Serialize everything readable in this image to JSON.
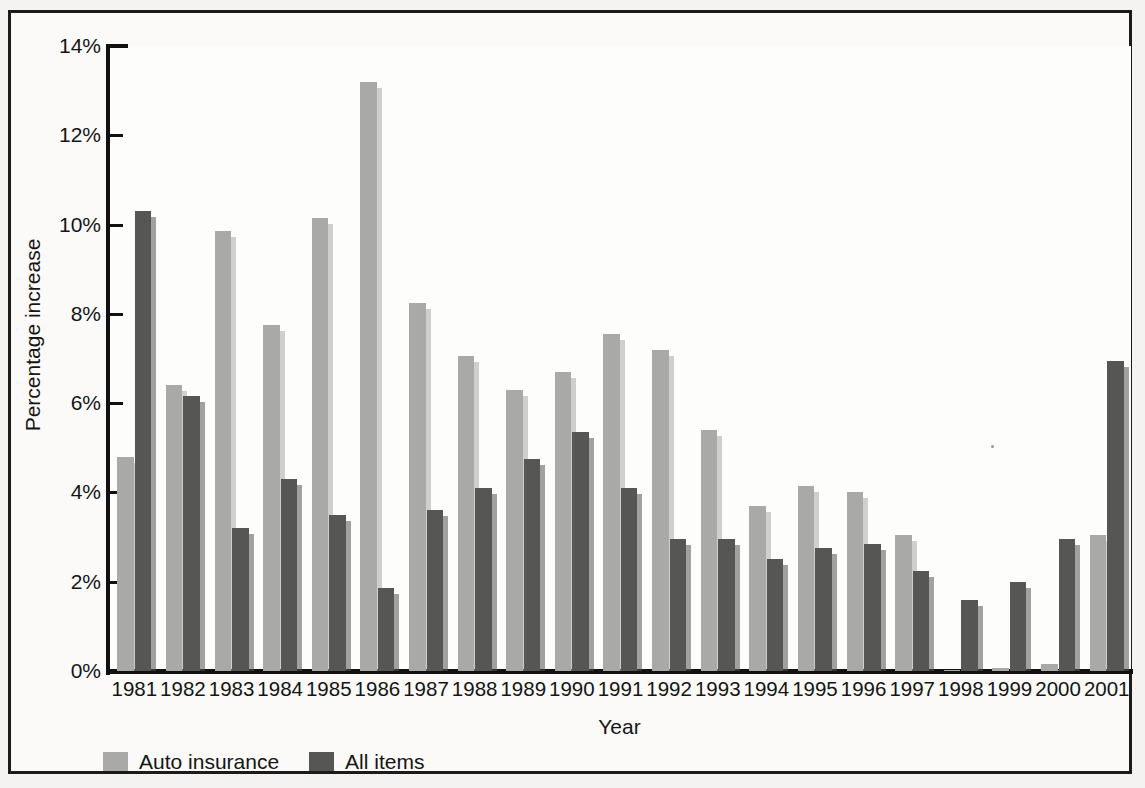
{
  "chart_data": {
    "type": "bar",
    "title": "",
    "xlabel": "Year",
    "ylabel": "Percentage increase",
    "ylim": [
      0,
      14
    ],
    "ytick_labels": [
      "0%",
      "2%",
      "4%",
      "6%",
      "8%",
      "10%",
      "12%",
      "14%"
    ],
    "ytick_values": [
      0,
      2,
      4,
      6,
      8,
      10,
      12,
      14
    ],
    "grid": false,
    "legend_position": "bottom-left",
    "categories": [
      "1981",
      "1982",
      "1983",
      "1984",
      "1985",
      "1986",
      "1987",
      "1988",
      "1989",
      "1990",
      "1991",
      "1992",
      "1993",
      "1994",
      "1995",
      "1996",
      "1997",
      "1998",
      "1999",
      "2000",
      "2001"
    ],
    "series": [
      {
        "name": "Auto insurance",
        "color": "#a9a9a7",
        "values": [
          4.8,
          6.4,
          9.85,
          7.75,
          10.15,
          13.2,
          8.25,
          7.05,
          6.3,
          6.7,
          7.55,
          7.2,
          5.4,
          3.7,
          4.15,
          4.0,
          3.05,
          0.03,
          0.06,
          0.15,
          3.05
        ]
      },
      {
        "name": "All items",
        "color": "#565654",
        "values": [
          10.3,
          6.15,
          3.2,
          4.3,
          3.5,
          1.85,
          3.6,
          4.1,
          4.75,
          5.35,
          4.1,
          2.95,
          2.95,
          2.5,
          2.75,
          2.85,
          2.25,
          1.6,
          2.0,
          2.95,
          6.95
        ]
      }
    ]
  },
  "legend": {
    "entries": [
      {
        "label": "Auto insurance",
        "color": "#a9a9a7"
      },
      {
        "label": "All items",
        "color": "#565654"
      }
    ]
  },
  "colors": {
    "light_bar": "#a9a9a7",
    "dark_bar": "#565654",
    "axis": "#111111",
    "text": "#151515",
    "page_background": "#f4f3f1",
    "plot_background": "#fdfdfc"
  }
}
